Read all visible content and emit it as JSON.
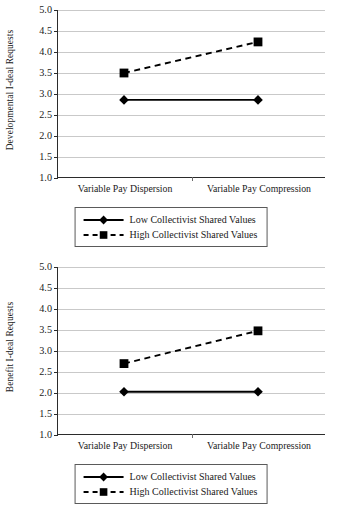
{
  "figure": {
    "panels": [
      {
        "id": "developmental",
        "ylabel": "Developmental I-deal Requests",
        "ytick_labels": [
          "5.0",
          "4.5",
          "4.0",
          "3.5",
          "3.0",
          "2.5",
          "2.0",
          "1.5",
          "1.0"
        ],
        "xtick_labels": [
          "Variable Pay Dispersion",
          "Variable Pay Compression"
        ],
        "legend": [
          {
            "label": "Low Collectivist Shared Values",
            "marker": "diamond-marker",
            "line": "solid"
          },
          {
            "label": "High Collectivist Shared Values",
            "marker": "square-marker",
            "line": "dashed"
          }
        ]
      },
      {
        "id": "benefit",
        "ylabel": "Benefit I-deal Requests",
        "ytick_labels": [
          "5.0",
          "4.5",
          "4.0",
          "3.5",
          "3.0",
          "2.5",
          "2.0",
          "1.5",
          "1.0"
        ],
        "xtick_labels": [
          "Variable Pay Dispersion",
          "Variable Pay Compression"
        ],
        "legend": [
          {
            "label": "Low Collectivist Shared Values",
            "marker": "diamond-marker",
            "line": "solid"
          },
          {
            "label": "High Collectivist Shared Values",
            "marker": "square-marker",
            "line": "dashed"
          }
        ]
      }
    ]
  },
  "chart_data": [
    {
      "type": "line",
      "title": "",
      "xlabel": "",
      "ylabel": "Developmental I-deal Requests",
      "categories": [
        "Variable Pay Dispersion",
        "Variable Pay Compression"
      ],
      "ylim": [
        1.0,
        5.0
      ],
      "yticks": [
        1.0,
        1.5,
        2.0,
        2.5,
        3.0,
        3.5,
        4.0,
        4.5,
        5.0
      ],
      "grid": true,
      "legend_position": "bottom",
      "series": [
        {
          "name": "Low Collectivist Shared Values",
          "values": [
            2.86,
            2.86
          ],
          "line": "solid",
          "marker": "diamond",
          "color": "#000000"
        },
        {
          "name": "High Collectivist Shared Values",
          "values": [
            3.5,
            4.24
          ],
          "line": "dashed",
          "marker": "square",
          "color": "#000000"
        }
      ]
    },
    {
      "type": "line",
      "title": "",
      "xlabel": "",
      "ylabel": "Benefit I-deal Requests",
      "categories": [
        "Variable Pay Dispersion",
        "Variable Pay Compression"
      ],
      "ylim": [
        1.0,
        5.0
      ],
      "yticks": [
        1.0,
        1.5,
        2.0,
        2.5,
        3.0,
        3.5,
        4.0,
        4.5,
        5.0
      ],
      "grid": true,
      "legend_position": "bottom",
      "series": [
        {
          "name": "Low Collectivist Shared Values",
          "values": [
            2.03,
            2.03
          ],
          "line": "solid",
          "marker": "diamond",
          "color": "#000000"
        },
        {
          "name": "High Collectivist Shared Values",
          "values": [
            2.7,
            3.48
          ],
          "line": "dashed",
          "marker": "square",
          "color": "#000000"
        }
      ]
    }
  ]
}
